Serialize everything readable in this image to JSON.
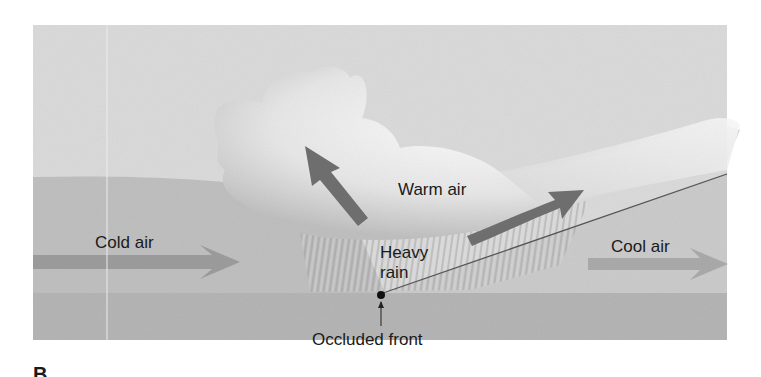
{
  "diagram": {
    "panel_letter": "B",
    "labels": {
      "warm_air": "Warm air",
      "cold_air": "Cold air",
      "cool_air": "Cool air",
      "heavy_rain_line1": "Heavy",
      "heavy_rain_line2": "rain",
      "occluded_front": "Occluded front"
    },
    "arrows": [
      {
        "name": "cold-air-flow",
        "direction": "right"
      },
      {
        "name": "cool-air-flow",
        "direction": "right"
      },
      {
        "name": "warm-air-rising-left",
        "direction": "up-left"
      },
      {
        "name": "warm-air-rising-right",
        "direction": "up-right"
      }
    ],
    "colors": {
      "sky": "#d9d9d9",
      "cold_air": "#bdbdbd",
      "cool_air": "#c9c9c9",
      "ground": "#b2b2b2",
      "arrow": "#8c8c8c",
      "warm_arrow": "#6e6e6e",
      "cloud": "#f2f2f2",
      "text": "#1a1a1a"
    }
  }
}
